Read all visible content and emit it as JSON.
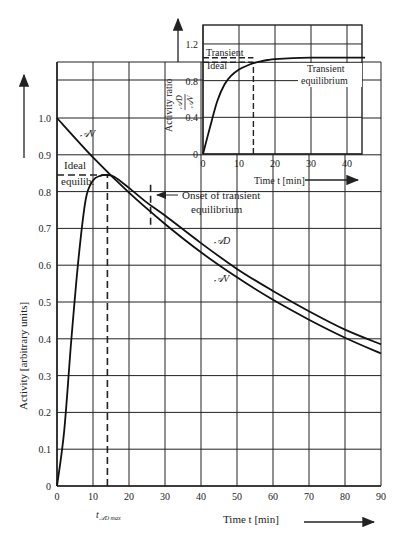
{
  "chart_data": [
    {
      "id": "main",
      "type": "line",
      "title": "",
      "xlabel": "Time t [min]",
      "ylabel": "Activity [arbitrary units]",
      "xlim": [
        0,
        90
      ],
      "ylim": [
        0,
        1.15
      ],
      "x_ticks": [
        0,
        10,
        20,
        30,
        40,
        50,
        60,
        70,
        80,
        90
      ],
      "y_ticks": [
        0,
        0.1,
        0.2,
        0.3,
        0.4,
        0.5,
        0.6,
        0.7,
        0.8,
        0.9,
        1.0
      ],
      "y_tick_labels": [
        "0",
        "0.1",
        "0.2",
        "0.3",
        "0.4",
        "0.5",
        "0.6",
        "0.7",
        "0.8",
        "0.9",
        "1.0"
      ],
      "grid": true,
      "series": [
        {
          "name": "A_V (parent)",
          "label": "𝒜V",
          "x": [
            0,
            10,
            20,
            30,
            40,
            50,
            60,
            70,
            80,
            90
          ],
          "values": [
            1.0,
            0.893,
            0.797,
            0.712,
            0.635,
            0.567,
            0.506,
            0.452,
            0.403,
            0.36
          ]
        },
        {
          "name": "A_D (daughter)",
          "label": "𝒜D",
          "x": [
            0,
            2,
            4,
            6,
            8,
            10,
            12,
            14,
            16,
            20,
            25,
            30,
            40,
            50,
            60,
            70,
            80,
            90
          ],
          "values": [
            0,
            0.15,
            0.4,
            0.62,
            0.78,
            0.83,
            0.843,
            0.845,
            0.84,
            0.81,
            0.77,
            0.735,
            0.66,
            0.59,
            0.53,
            0.475,
            0.425,
            0.385
          ]
        }
      ],
      "annotations": [
        {
          "text": "Ideal",
          "x": 3,
          "y": 0.87
        },
        {
          "text": "equilib.",
          "x": 3,
          "y": 0.83
        },
        {
          "text": "Onset of transient",
          "x": 40,
          "y": 0.79
        },
        {
          "text": "equilibrium",
          "x": 43,
          "y": 0.75
        },
        {
          "text": "t_𝒜D max",
          "x": 14,
          "y": -0.07
        }
      ],
      "reference_lines": [
        {
          "type": "hline_dashed",
          "y": 0.845,
          "x_from": 0,
          "x_to": 14,
          "label": "Ideal equilib."
        },
        {
          "type": "vline_dashed",
          "x": 14,
          "y_from": 0,
          "y_to": 0.845,
          "label": "t_AD max"
        },
        {
          "type": "vline_dashed",
          "x": 26,
          "y_from": 0.71,
          "y_to": 0.82,
          "label": "Onset of transient equilibrium"
        }
      ]
    },
    {
      "id": "inset",
      "type": "line",
      "title": "",
      "xlabel": "Time t [min]",
      "ylabel": "Activity ratio 𝒜D / 𝒜V",
      "xlim": [
        0,
        45
      ],
      "ylim": [
        0,
        1.4
      ],
      "x_ticks": [
        0,
        10,
        20,
        30,
        40
      ],
      "y_ticks": [
        0,
        0.4,
        0.8,
        1.2
      ],
      "y_tick_labels": [
        "0",
        "0.4",
        "0.8",
        "1.2"
      ],
      "grid": true,
      "series": [
        {
          "name": "A_D / A_V",
          "x": [
            0,
            2,
            4,
            6,
            8,
            10,
            12,
            14,
            16,
            18,
            20,
            25,
            30,
            35,
            40,
            45
          ],
          "values": [
            0,
            0.3,
            0.58,
            0.76,
            0.86,
            0.92,
            0.96,
            0.99,
            1.01,
            1.025,
            1.035,
            1.045,
            1.05,
            1.05,
            1.05,
            1.05
          ]
        }
      ],
      "annotations": [
        {
          "text": "Transient",
          "x": 3,
          "y": 1.12
        },
        {
          "text": "Ideal",
          "x": 3,
          "y": 0.92
        },
        {
          "text": "Transient",
          "x": 35,
          "y": 0.96
        },
        {
          "text": "equilibrium",
          "x": 35,
          "y": 0.84
        }
      ],
      "reference_lines": [
        {
          "type": "hline_dashed",
          "y": 1.05,
          "x_from": 0,
          "x_to": 14,
          "label": "Transient"
        },
        {
          "type": "hline_dashed",
          "y": 1.0,
          "x_from": 0,
          "x_to": 14,
          "label": "Ideal"
        },
        {
          "type": "vline_dashed",
          "x": 14,
          "y_from": 0,
          "y_to": 1.0
        }
      ]
    }
  ],
  "labels": {
    "main_xlabel": "Time t  [min]",
    "main_ylabel": "Activity [arbitrary units]",
    "inset_xlabel": "Time t [min]",
    "inset_ylabel": "Activity ratio",
    "inset_ratio_num": "𝒜D",
    "inset_ratio_den": "𝒜V",
    "series_av": "𝒜V",
    "series_ad": "𝒜D",
    "ideal": "Ideal",
    "equilib": "equilib.",
    "onset_1": "Onset of transient",
    "onset_2": "equilibrium",
    "tmax": "t",
    "tmax_sub": "𝒜D max",
    "inset_transient": "Transient",
    "inset_ideal": "Ideal",
    "inset_te_1": "Transient",
    "inset_te_2": "equilibrium"
  }
}
